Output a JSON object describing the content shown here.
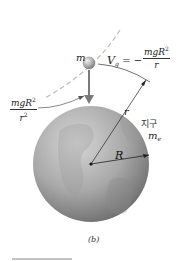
{
  "diagram": {
    "type": "gravitational-potential-figure",
    "caption": "(b)",
    "labels": {
      "particle_mass": "m",
      "potential_lhs": "V",
      "potential_lhs_sub": "g",
      "potential_eq": "= −",
      "potential_num": "mgR",
      "potential_num_sup": "2",
      "potential_den": "r",
      "force_num": "mgR",
      "force_num_sup": "2",
      "force_den": "r",
      "force_den_sup": "2",
      "distance_r": "r",
      "earth_label": "지구",
      "earth_mass": "m",
      "earth_mass_sub": "e",
      "earth_radius": "R"
    },
    "colors": {
      "globe_light": "#c9c9c9",
      "globe_dark": "#6e6e6e",
      "ball": "#9a9a9a",
      "arrow": "#7a7a7a",
      "dashed_arc": "#bdbdbd",
      "line": "#333333",
      "rule": "#888888"
    }
  }
}
